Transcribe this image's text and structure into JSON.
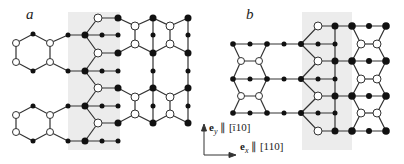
{
  "panels": [
    {
      "id": "a",
      "label": "a"
    },
    {
      "id": "b",
      "label": "b"
    }
  ],
  "axes": {
    "y_vector": "e",
    "y_sub": "y",
    "y_direction": "[ī10]",
    "y_text": "∥ [ī10]",
    "x_vector": "e",
    "x_sub": "x",
    "x_text": "∥ [110]"
  },
  "colors": {
    "shade": "#ececec",
    "bond": "#333333",
    "filled_atom": "#111111",
    "open_atom": "#ffffff"
  }
}
